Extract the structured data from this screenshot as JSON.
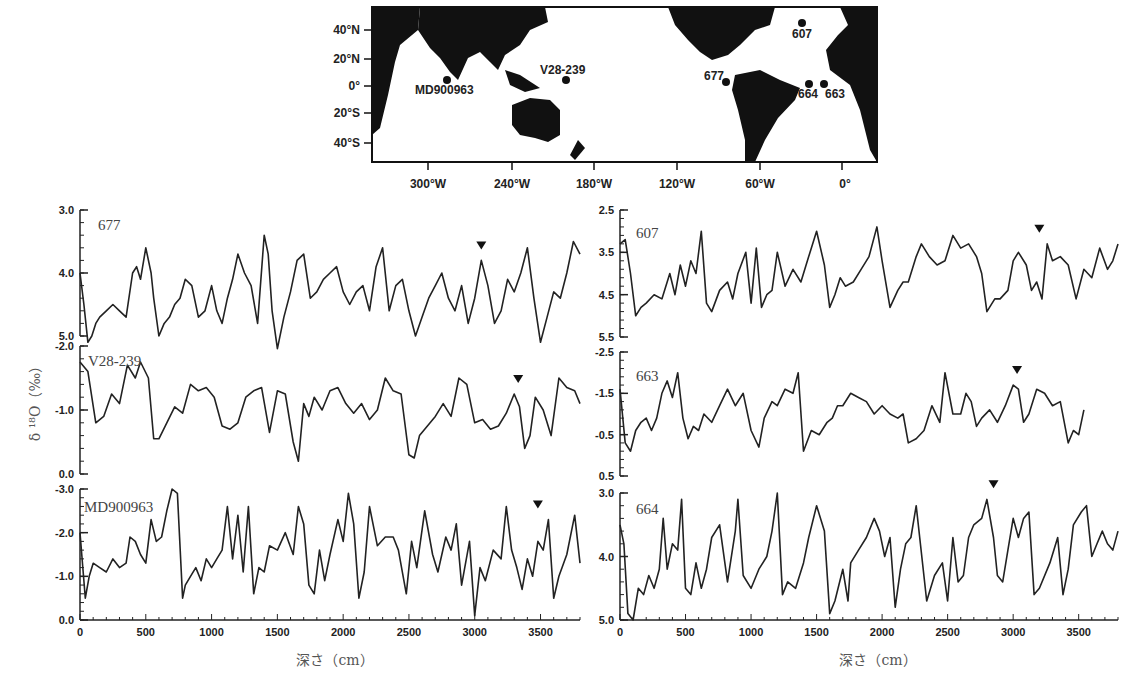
{
  "map": {
    "lat_ticks": [
      "40°N",
      "20°N",
      "0°",
      "20°S",
      "40°S"
    ],
    "lon_ticks": [
      "300°W",
      "240°W",
      "180°W",
      "120°W",
      "60°W",
      "0°"
    ],
    "sites": [
      {
        "name": "607",
        "x": 802,
        "y": 23,
        "lx": 792,
        "ly": 38
      },
      {
        "name": "MD900963",
        "x": 447,
        "y": 80,
        "lx": 415,
        "ly": 94
      },
      {
        "name": "V28-239",
        "x": 566,
        "y": 80,
        "lx": 540,
        "ly": 74
      },
      {
        "name": "677",
        "x": 726,
        "y": 82,
        "lx": 704,
        "ly": 80
      },
      {
        "name": "664",
        "x": 809,
        "y": 84,
        "lx": 798,
        "ly": 98
      },
      {
        "name": "663",
        "x": 824,
        "y": 84,
        "lx": 825,
        "ly": 98
      }
    ]
  },
  "axis": {
    "ylabel": "δ ¹⁸O（‰）",
    "xlabel": "深さ（cm）",
    "x_ticks": [
      "0",
      "500",
      "1000",
      "1500",
      "2000",
      "2500",
      "3000",
      "3500"
    ]
  },
  "chart_data": [
    {
      "type": "line",
      "title": "677",
      "xlabel": "深さ（cm）",
      "ylabel": "δ18O (‰)",
      "xlim": [
        0,
        3800
      ],
      "ylim": [
        3.0,
        5.5
      ],
      "y_inverted": true,
      "y_ticks": [
        "3.0",
        "4.0",
        "5.0"
      ],
      "marker_x": 3050,
      "x": [
        0,
        30,
        60,
        90,
        120,
        150,
        200,
        250,
        300,
        350,
        400,
        430,
        460,
        500,
        540,
        560,
        600,
        640,
        680,
        720,
        760,
        800,
        850,
        900,
        950,
        1000,
        1040,
        1080,
        1120,
        1160,
        1200,
        1250,
        1300,
        1350,
        1400,
        1430,
        1460,
        1500,
        1550,
        1600,
        1650,
        1700,
        1750,
        1800,
        1850,
        1900,
        1950,
        2000,
        2050,
        2100,
        2150,
        2200,
        2250,
        2300,
        2350,
        2400,
        2450,
        2500,
        2550,
        2600,
        2650,
        2700,
        2750,
        2800,
        2850,
        2900,
        2950,
        3000,
        3050,
        3100,
        3150,
        3200,
        3250,
        3300,
        3350,
        3400,
        3450,
        3500,
        3550,
        3600,
        3650,
        3700,
        3750,
        3800
      ],
      "values": [
        4.0,
        4.5,
        5.1,
        5.0,
        4.8,
        4.7,
        4.6,
        4.5,
        4.6,
        4.7,
        4.0,
        3.9,
        4.1,
        3.6,
        4.0,
        4.4,
        5.0,
        4.8,
        4.7,
        4.5,
        4.4,
        4.1,
        4.2,
        4.7,
        4.6,
        4.2,
        4.6,
        4.8,
        4.4,
        4.1,
        3.7,
        4.0,
        4.2,
        4.8,
        3.4,
        3.7,
        4.6,
        5.2,
        4.7,
        4.3,
        3.8,
        3.7,
        4.4,
        4.3,
        4.1,
        4.0,
        3.9,
        4.3,
        4.5,
        4.3,
        4.2,
        4.6,
        3.9,
        3.6,
        4.6,
        4.2,
        4.1,
        4.6,
        5.0,
        4.7,
        4.4,
        4.2,
        4.0,
        4.4,
        4.6,
        4.2,
        4.8,
        4.4,
        3.8,
        4.2,
        4.8,
        4.6,
        4.1,
        4.3,
        4.0,
        3.6,
        4.4,
        5.1,
        4.7,
        4.3,
        4.4,
        4.0,
        3.5,
        3.7
      ]
    },
    {
      "type": "line",
      "title": "V28-239",
      "xlim": [
        0,
        3800
      ],
      "ylim": [
        -2.0,
        0.0
      ],
      "y_inverted": true,
      "y_ticks": [
        "-2.0",
        "-1.0",
        "0.0"
      ],
      "marker_x": 3330,
      "x": [
        0,
        60,
        120,
        180,
        240,
        300,
        360,
        420,
        460,
        520,
        560,
        600,
        660,
        720,
        780,
        840,
        900,
        960,
        1020,
        1080,
        1140,
        1200,
        1260,
        1320,
        1380,
        1440,
        1500,
        1560,
        1620,
        1660,
        1700,
        1740,
        1780,
        1840,
        1900,
        1960,
        2020,
        2080,
        2140,
        2200,
        2260,
        2320,
        2380,
        2440,
        2500,
        2540,
        2580,
        2640,
        2700,
        2760,
        2820,
        2880,
        2940,
        3000,
        3060,
        3120,
        3180,
        3240,
        3300,
        3340,
        3380,
        3420,
        3460,
        3520,
        3580,
        3640,
        3700,
        3760,
        3800
      ],
      "values": [
        -1.75,
        -1.6,
        -0.8,
        -0.9,
        -1.25,
        -1.1,
        -1.7,
        -1.5,
        -1.75,
        -1.5,
        -0.55,
        -0.55,
        -0.8,
        -1.05,
        -0.95,
        -1.4,
        -1.3,
        -1.35,
        -1.2,
        -0.75,
        -0.7,
        -0.8,
        -1.2,
        -1.3,
        -1.35,
        -0.65,
        -1.3,
        -1.25,
        -0.5,
        -0.2,
        -1.1,
        -0.9,
        -1.2,
        -1.0,
        -1.3,
        -1.35,
        -1.1,
        -0.95,
        -1.1,
        -0.85,
        -1.0,
        -1.5,
        -1.3,
        -1.25,
        -0.3,
        -0.25,
        -0.6,
        -0.75,
        -0.9,
        -1.1,
        -0.9,
        -1.5,
        -1.4,
        -0.8,
        -0.85,
        -0.7,
        -0.75,
        -0.95,
        -1.25,
        -1.05,
        -0.4,
        -0.6,
        -1.2,
        -1.0,
        -0.6,
        -1.5,
        -1.35,
        -1.3,
        -1.1
      ]
    },
    {
      "type": "line",
      "title": "MD900963",
      "xlim": [
        0,
        3800
      ],
      "ylim": [
        0.0,
        -3.3
      ],
      "y_inverted": true,
      "y_ticks": [
        "-3.0",
        "-2.0",
        "-1.0",
        "0.0"
      ],
      "x_ticks": [
        0,
        500,
        1000,
        1500,
        2000,
        2500,
        3000,
        3500
      ],
      "marker_x": 3480,
      "x": [
        0,
        40,
        70,
        100,
        150,
        200,
        250,
        300,
        350,
        380,
        420,
        460,
        500,
        540,
        580,
        620,
        660,
        700,
        740,
        780,
        800,
        840,
        880,
        920,
        960,
        1000,
        1040,
        1080,
        1120,
        1160,
        1200,
        1240,
        1280,
        1320,
        1360,
        1400,
        1440,
        1500,
        1560,
        1620,
        1660,
        1700,
        1740,
        1780,
        1820,
        1860,
        1900,
        1960,
        2000,
        2040,
        2080,
        2120,
        2160,
        2200,
        2260,
        2320,
        2380,
        2420,
        2480,
        2520,
        2560,
        2620,
        2680,
        2720,
        2780,
        2820,
        2860,
        2900,
        2960,
        3000,
        3040,
        3080,
        3140,
        3200,
        3240,
        3280,
        3320,
        3360,
        3400,
        3440,
        3480,
        3520,
        3560,
        3600,
        3640,
        3700,
        3760,
        3800
      ],
      "values": [
        -2.0,
        -0.5,
        -1.0,
        -1.3,
        -1.2,
        -1.1,
        -1.4,
        -1.2,
        -1.3,
        -1.9,
        -1.8,
        -1.5,
        -1.3,
        -2.3,
        -1.8,
        -1.9,
        -2.5,
        -3.0,
        -2.9,
        -0.5,
        -0.8,
        -1.0,
        -1.2,
        -0.9,
        -1.4,
        -1.2,
        -1.4,
        -1.6,
        -2.6,
        -1.4,
        -2.4,
        -1.1,
        -2.6,
        -0.6,
        -1.2,
        -1.1,
        -1.7,
        -1.6,
        -2.0,
        -1.5,
        -2.6,
        -2.2,
        -0.8,
        -0.6,
        -1.6,
        -0.9,
        -1.5,
        -2.3,
        -1.8,
        -2.9,
        -2.2,
        -0.5,
        -1.1,
        -2.6,
        -1.7,
        -1.9,
        -1.9,
        -1.6,
        -0.6,
        -1.8,
        -1.2,
        -2.5,
        -1.5,
        -1.1,
        -1.9,
        -1.6,
        -2.2,
        -0.8,
        -1.8,
        -0.1,
        -1.2,
        -0.9,
        -1.6,
        -1.4,
        -2.6,
        -1.6,
        -1.2,
        -0.7,
        -1.4,
        -1.0,
        -1.8,
        -1.6,
        -2.3,
        -0.5,
        -1.0,
        -1.5,
        -2.4,
        -1.3
      ]
    },
    {
      "type": "line",
      "title": "607",
      "xlim": [
        0,
        3800
      ],
      "ylim": [
        2.5,
        5.5
      ],
      "y_inverted": true,
      "y_ticks": [
        "2.5",
        "3.5",
        "4.5",
        "5.5"
      ],
      "marker_x": 3200,
      "x": [
        0,
        40,
        80,
        120,
        160,
        200,
        260,
        320,
        380,
        420,
        460,
        500,
        540,
        580,
        620,
        660,
        700,
        760,
        820,
        860,
        900,
        960,
        1000,
        1040,
        1080,
        1120,
        1160,
        1200,
        1260,
        1320,
        1380,
        1440,
        1500,
        1560,
        1600,
        1640,
        1680,
        1720,
        1780,
        1840,
        1900,
        1960,
        2000,
        2060,
        2120,
        2160,
        2200,
        2260,
        2300,
        2360,
        2420,
        2480,
        2540,
        2600,
        2660,
        2720,
        2760,
        2800,
        2860,
        2900,
        2960,
        3000,
        3040,
        3100,
        3140,
        3180,
        3220,
        3260,
        3300,
        3360,
        3420,
        3480,
        3540,
        3600,
        3660,
        3720,
        3760,
        3800
      ],
      "values": [
        3.3,
        3.2,
        4.0,
        5.0,
        4.8,
        4.7,
        4.5,
        4.6,
        4.0,
        4.5,
        3.8,
        4.3,
        3.7,
        4.0,
        3.0,
        4.7,
        4.9,
        4.4,
        4.2,
        4.6,
        4.0,
        3.5,
        4.7,
        3.4,
        4.8,
        4.5,
        4.4,
        3.5,
        4.3,
        3.9,
        4.2,
        3.6,
        3.0,
        3.8,
        4.8,
        4.5,
        4.1,
        4.3,
        4.2,
        3.9,
        3.6,
        2.9,
        3.7,
        4.8,
        4.4,
        4.2,
        4.2,
        3.6,
        3.3,
        3.6,
        3.8,
        3.7,
        3.1,
        3.4,
        3.3,
        3.6,
        4.0,
        4.9,
        4.6,
        4.6,
        4.4,
        3.7,
        3.5,
        3.8,
        4.4,
        4.2,
        4.6,
        3.3,
        3.7,
        3.6,
        3.8,
        4.6,
        3.9,
        4.1,
        3.4,
        3.9,
        3.7,
        3.3
      ]
    },
    {
      "type": "line",
      "title": "663",
      "xlim": [
        0,
        3800
      ],
      "ylim": [
        -2.5,
        0.5
      ],
      "y_inverted": true,
      "y_ticks": [
        "-2.5",
        "-1.5",
        "-0.5",
        "0.5"
      ],
      "marker_x": 3030,
      "x": [
        0,
        40,
        80,
        120,
        160,
        200,
        240,
        280,
        320,
        360,
        400,
        440,
        480,
        520,
        560,
        600,
        640,
        700,
        760,
        820,
        880,
        940,
        1000,
        1060,
        1100,
        1160,
        1200,
        1260,
        1320,
        1360,
        1400,
        1460,
        1520,
        1580,
        1620,
        1660,
        1700,
        1760,
        1820,
        1880,
        1940,
        2000,
        2060,
        2120,
        2160,
        2200,
        2260,
        2320,
        2380,
        2440,
        2480,
        2540,
        2600,
        2640,
        2680,
        2720,
        2760,
        2820,
        2880,
        2940,
        3000,
        3040,
        3080,
        3120,
        3180,
        3240,
        3300,
        3360,
        3420,
        3460,
        3500,
        3540
      ],
      "values": [
        -1.6,
        -0.3,
        -0.1,
        -0.6,
        -0.8,
        -0.9,
        -0.6,
        -0.9,
        -1.5,
        -1.8,
        -1.4,
        -2.0,
        -0.9,
        -0.4,
        -0.7,
        -0.6,
        -1.0,
        -0.8,
        -1.2,
        -1.6,
        -1.2,
        -1.5,
        -0.6,
        -0.2,
        -0.9,
        -1.3,
        -1.2,
        -1.6,
        -1.5,
        -2.0,
        -0.1,
        -0.6,
        -0.5,
        -0.8,
        -0.9,
        -1.2,
        -1.2,
        -1.5,
        -1.4,
        -1.3,
        -1.0,
        -1.2,
        -1.0,
        -0.9,
        -1.0,
        -0.3,
        -0.4,
        -0.6,
        -1.2,
        -0.8,
        -2.0,
        -1.0,
        -1.0,
        -1.5,
        -1.3,
        -0.7,
        -0.9,
        -1.1,
        -0.8,
        -1.2,
        -1.7,
        -1.6,
        -0.8,
        -1.0,
        -1.6,
        -1.5,
        -1.2,
        -1.3,
        -0.3,
        -0.6,
        -0.5,
        -1.1
      ]
    },
    {
      "type": "line",
      "title": "664",
      "xlim": [
        0,
        3800
      ],
      "ylim": [
        3.0,
        5.0
      ],
      "y_inverted": true,
      "y_ticks": [
        "3.0",
        "4.0",
        "5.0"
      ],
      "x_ticks": [
        0,
        500,
        1000,
        1500,
        2000,
        2500,
        3000,
        3500
      ],
      "marker_x": 2850,
      "x": [
        0,
        30,
        60,
        100,
        140,
        180,
        220,
        260,
        300,
        330,
        360,
        400,
        440,
        470,
        500,
        540,
        580,
        620,
        660,
        700,
        760,
        820,
        880,
        900,
        940,
        1000,
        1060,
        1120,
        1160,
        1200,
        1240,
        1280,
        1340,
        1400,
        1440,
        1500,
        1560,
        1600,
        1640,
        1700,
        1740,
        1760,
        1820,
        1880,
        1940,
        1980,
        2020,
        2060,
        2100,
        2140,
        2180,
        2220,
        2260,
        2340,
        2400,
        2460,
        2500,
        2540,
        2580,
        2620,
        2660,
        2700,
        2760,
        2800,
        2850,
        2880,
        2920,
        2960,
        3000,
        3040,
        3080,
        3120,
        3160,
        3200,
        3280,
        3340,
        3380,
        3420,
        3460,
        3520,
        3560,
        3600,
        3640,
        3680,
        3720,
        3760,
        3800
      ],
      "values": [
        3.5,
        3.8,
        4.9,
        5.0,
        4.5,
        4.6,
        4.3,
        4.5,
        4.2,
        3.4,
        4.2,
        3.8,
        3.9,
        3.1,
        4.5,
        4.6,
        4.1,
        4.5,
        4.2,
        3.7,
        3.5,
        4.4,
        3.6,
        3.1,
        4.3,
        4.5,
        4.2,
        4.0,
        3.6,
        3.0,
        4.6,
        4.4,
        4.5,
        4.1,
        3.7,
        3.2,
        3.6,
        4.9,
        4.7,
        4.2,
        4.7,
        4.1,
        3.9,
        3.7,
        3.4,
        3.6,
        4.0,
        3.7,
        4.8,
        4.2,
        3.8,
        3.7,
        3.2,
        4.7,
        4.3,
        4.1,
        4.7,
        3.7,
        4.4,
        4.3,
        3.7,
        3.5,
        3.4,
        3.1,
        3.7,
        4.3,
        4.4,
        3.9,
        3.4,
        3.7,
        3.4,
        3.3,
        4.6,
        4.5,
        4.1,
        3.7,
        4.6,
        4.2,
        3.5,
        3.3,
        3.2,
        4.0,
        3.8,
        3.6,
        3.8,
        3.9,
        3.6
      ]
    }
  ]
}
